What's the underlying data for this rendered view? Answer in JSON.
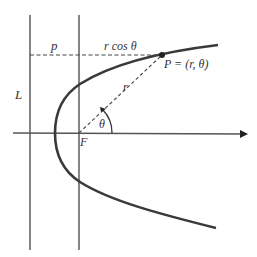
{
  "diagram": {
    "labels": {
      "directrix": "L",
      "distance_p": "p",
      "r_cos_theta": "r cos θ",
      "point": "P = (r, θ)",
      "radius": "r",
      "angle": "θ",
      "focus": "F"
    },
    "colors": {
      "curve": "#3a3a3a",
      "lines": "#444444",
      "text": "#333333"
    }
  }
}
